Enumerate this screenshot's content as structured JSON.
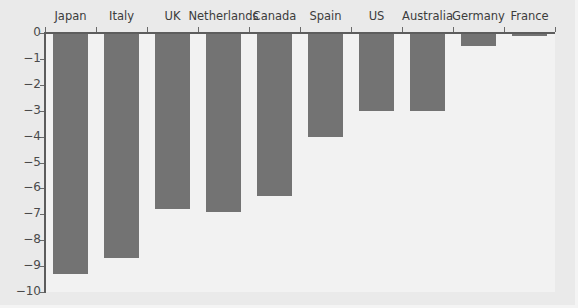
{
  "chart_data": {
    "type": "bar",
    "title": "",
    "subtitle": "",
    "xlabel": "",
    "ylabel": "",
    "orientation": "vertical",
    "categories": [
      "Japan",
      "Italy",
      "UK",
      "Netherlands",
      "Canada",
      "Spain",
      "US",
      "Australia",
      "Germany",
      "France"
    ],
    "values": [
      -9.3,
      -8.7,
      -6.8,
      -6.9,
      -6.3,
      -4.0,
      -3.0,
      -3.0,
      -0.5,
      -0.1
    ],
    "series": [
      {
        "name": "",
        "values": [
          -9.3,
          -8.7,
          -6.8,
          -6.9,
          -6.3,
          -4.0,
          -3.0,
          -3.0,
          -0.5,
          -0.1
        ]
      }
    ],
    "ylim": [
      -10,
      0
    ],
    "xlim": [
      0,
      10
    ],
    "ytick_labels": [
      "0",
      "−1",
      "−2",
      "−3",
      "−4",
      "−5",
      "−6",
      "−7",
      "−8",
      "−9",
      "−10"
    ],
    "ytick_values": [
      0,
      -1,
      -2,
      -3,
      -4,
      -5,
      -6,
      -7,
      -8,
      -9,
      -10
    ],
    "xtick_labels": [
      "Japan",
      "Italy",
      "UK",
      "Netherlands",
      "Canada",
      "Spain",
      "US",
      "Australia",
      "Germany",
      "France"
    ],
    "xtick_label_position": "top",
    "grid": false,
    "legend": null,
    "legend_position": "none",
    "annotations": [],
    "colors": {
      "bar": "#737373",
      "figure_background": "#eaeaea",
      "plot_background": "#f2f2f2",
      "axis_line": "#5d5d5d",
      "tick_mark": "#6a6a6a",
      "tick_label_text": "#4a4a4a",
      "category_label_text": "#3c3c3c"
    }
  }
}
